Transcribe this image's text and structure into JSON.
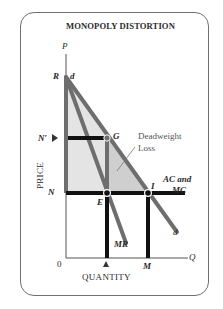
{
  "title": "MONOPOLY DISTORTION",
  "axes": {
    "y_axis_symbol": "P",
    "x_axis_symbol": "Q",
    "y_axis_title": "PRICE",
    "x_axis_title": "QUANTITY",
    "origin": "0"
  },
  "points": {
    "R": "R",
    "N_prime": "N′",
    "N": "N",
    "G": "G",
    "E": "E",
    "I": "I",
    "M": "M"
  },
  "curves": {
    "demand_top": "d",
    "demand_bottom": "d",
    "marginal_revenue": "MR",
    "cost_line_line1": "AC and",
    "cost_line_line2": "MC"
  },
  "annotations": {
    "deadweight_line1": "Deadweight",
    "deadweight_line2": "Loss"
  },
  "colors": {
    "curve_gray": "#6e6e6e",
    "bar_black": "#111111",
    "profit_fill": "#e4e4e4",
    "deadweight_fill": "#cfcfcf",
    "border": "#6f6f6f"
  }
}
